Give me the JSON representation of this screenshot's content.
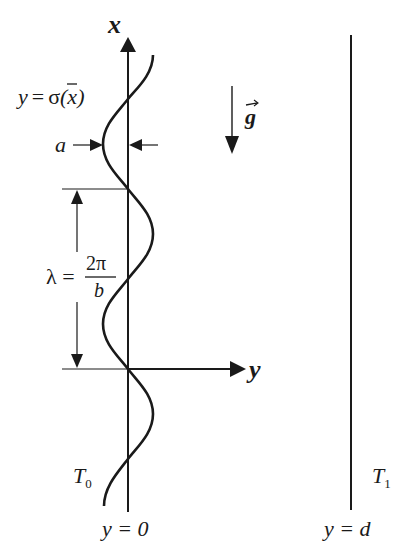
{
  "diagram": {
    "axes": {
      "x_label": "x",
      "y_label": "y"
    },
    "labels": {
      "curve": "y = σ̄(x)",
      "curve_y": "y",
      "curve_eq": "=",
      "curve_sigma": "σ",
      "curve_arg": "(x)",
      "amplitude": "a",
      "gravity": "g",
      "wavelength_lhs": "λ =",
      "wavelength_num": "2π",
      "wavelength_den": "b",
      "left_temp": "T",
      "left_temp_sub": "0",
      "right_temp": "T",
      "right_temp_sub": "1",
      "left_wall_pos": "y = 0",
      "right_wall_pos": "y = d"
    },
    "colors": {
      "stroke": "#1a1a1a",
      "background": "#ffffff"
    }
  }
}
